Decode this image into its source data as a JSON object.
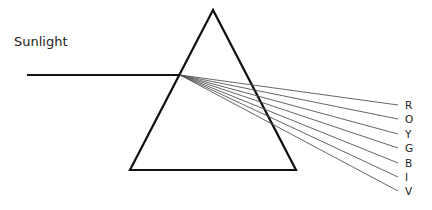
{
  "diagram": {
    "incident_label": "Sunlight",
    "colors": {
      "stroke": "#111111",
      "ray": "#555555",
      "text": "#222222"
    },
    "prism": {
      "apex": [
        213,
        10
      ],
      "left_base": [
        130,
        170
      ],
      "right_base": [
        296,
        170
      ]
    },
    "incident_ray": {
      "from": [
        27,
        75
      ],
      "to": [
        180,
        75
      ]
    },
    "spectrum": [
      {
        "label": "R",
        "end": [
          398,
          105
        ]
      },
      {
        "label": "O",
        "end": [
          398,
          119
        ]
      },
      {
        "label": "Y",
        "end": [
          398,
          134
        ]
      },
      {
        "label": "G",
        "end": [
          398,
          148
        ]
      },
      {
        "label": "B",
        "end": [
          398,
          163
        ]
      },
      {
        "label": "I",
        "end": [
          398,
          177
        ]
      },
      {
        "label": "V",
        "end": [
          398,
          191
        ]
      }
    ]
  }
}
